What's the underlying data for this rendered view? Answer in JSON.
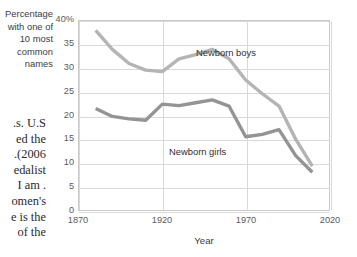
{
  "page": {
    "background": "#ffffff",
    "body_text_lines": [
      "s. U.S.",
      "ed the",
      "2006).",
      "edalist",
      ". I am",
      "omen's",
      "e is the",
      "of the"
    ]
  },
  "chart_data": {
    "type": "line",
    "title": "",
    "xlabel": "Year",
    "ylabel_lines": [
      "Percentage",
      "with one of",
      "10 most",
      "common",
      "names"
    ],
    "ylabel": "Percentage with one of 10 most common names",
    "xlim": [
      1870,
      2020
    ],
    "ylim": [
      0,
      40
    ],
    "xticks": [
      "1870",
      "1920",
      "1970",
      "2020"
    ],
    "xtick_values": [
      1870,
      1920,
      1970,
      2020
    ],
    "yticks": [
      "0",
      "5",
      "10",
      "15",
      "20",
      "25",
      "30",
      "35",
      "40%"
    ],
    "ytick_values": [
      0,
      5,
      10,
      15,
      20,
      25,
      30,
      35,
      40
    ],
    "grid": "horizontal-and-vertical",
    "legend_position": "inline-labels",
    "x": [
      1880,
      1890,
      1900,
      1910,
      1920,
      1930,
      1940,
      1950,
      1960,
      1970,
      1980,
      1990,
      2000,
      2010
    ],
    "series": [
      {
        "name": "Newborn boys",
        "color": "#b4b4b4",
        "label_x": 1900,
        "label_y": 37,
        "values": [
          38.0,
          34.0,
          31.0,
          29.6,
          29.3,
          32.0,
          32.9,
          34.0,
          32.0,
          27.5,
          24.6,
          22.0,
          15.0,
          9.3
        ]
      },
      {
        "name": "Newborn girls",
        "color": "#949494",
        "label_x": 1888,
        "label_y": 16.6,
        "values": [
          21.5,
          19.8,
          19.3,
          19.0,
          22.4,
          22.1,
          22.7,
          23.3,
          22.0,
          15.5,
          16.0,
          17.0,
          11.5,
          8.0
        ]
      }
    ]
  }
}
